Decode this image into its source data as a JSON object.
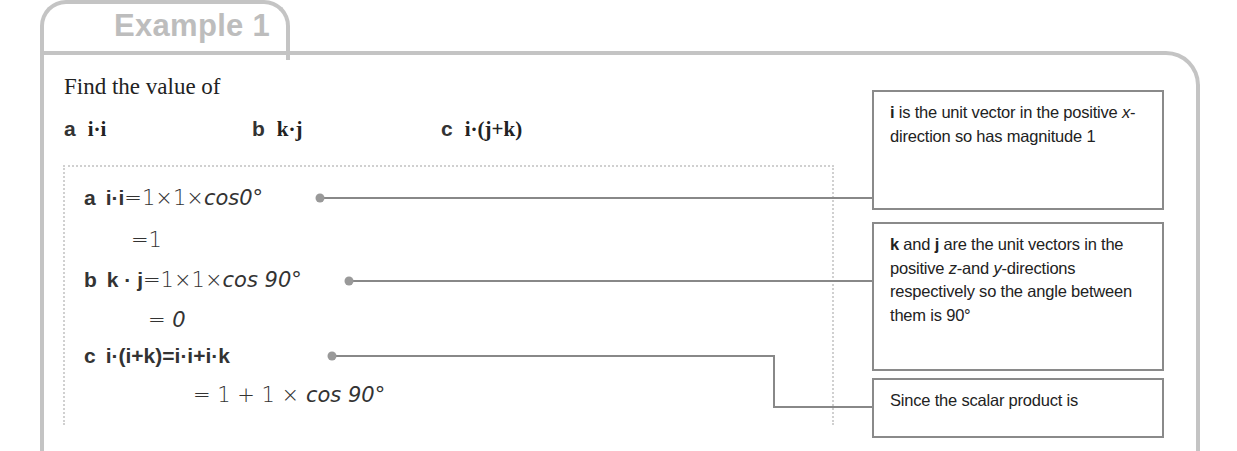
{
  "example": {
    "tab_label": "Example 1",
    "prompt": "Find the value of",
    "parts": [
      {
        "label": "a",
        "expression": "i·i"
      },
      {
        "label": "b",
        "expression": "k·j"
      },
      {
        "label": "c",
        "expression": "i·(j+k)"
      }
    ]
  },
  "solution": {
    "lines": [
      {
        "label": "a",
        "lhs": "i·i",
        "rhs": "=1×1×",
        "func": "cos",
        "arg": "0°"
      },
      {
        "label": "",
        "lhs": "",
        "rhs": "=1",
        "func": "",
        "arg": ""
      },
      {
        "label": "b",
        "lhs": "k · j",
        "rhs": "=1×1×",
        "func": "cos ",
        "arg": "90°"
      },
      {
        "label": "",
        "lhs": "",
        "rhs": "= ",
        "func": "",
        "arg": "0"
      },
      {
        "label": "c",
        "lhs": "i·(i+k)",
        "rhs": "=i·i+i·k",
        "func": "",
        "arg": ""
      },
      {
        "label": "",
        "lhs": "",
        "rhs": "= 1 + 1 × ",
        "func": "cos ",
        "arg": "90°"
      }
    ]
  },
  "notes": [
    {
      "bold_lead": "i",
      "segments": [
        " is the unit vector in the positive ",
        "x",
        "-direction so has magnitude 1"
      ]
    },
    {
      "bold_lead": "k",
      "segments": [
        " and ",
        "j",
        " are the unit vectors in the positive ",
        "z",
        "-and ",
        "y",
        "-directions respectively so the angle between them is 90°"
      ]
    },
    {
      "bold_lead": "",
      "segments": [
        "Since the scalar product is"
      ]
    }
  ],
  "colors": {
    "frame": "#c4c4c4",
    "tab_text": "#bdbdbd",
    "note_border": "#8a8a8a",
    "connector": "#888888"
  }
}
